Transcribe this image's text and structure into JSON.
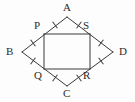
{
  "figure": {
    "background_color": "#fdfdfd",
    "stroke_color": "#3a3a3a",
    "label_color": "#2b2b2b",
    "tick_color": "#3a3a3a"
  },
  "outer_quadrilateral": {
    "name": "rhombus-abcd",
    "vertices": [
      {
        "id": "A",
        "label": "A",
        "x": 67,
        "y": 17
      },
      {
        "id": "B",
        "label": "B",
        "x": 22,
        "y": 52
      },
      {
        "id": "C",
        "label": "C",
        "x": 67,
        "y": 86
      },
      {
        "id": "D",
        "label": "D",
        "x": 113,
        "y": 52
      }
    ],
    "edges": [
      {
        "from": "A",
        "to": "B"
      },
      {
        "from": "B",
        "to": "C"
      },
      {
        "from": "C",
        "to": "D"
      },
      {
        "from": "D",
        "to": "A"
      }
    ]
  },
  "inner_quadrilateral": {
    "name": "rectangle-pqrs",
    "vertices": [
      {
        "id": "P",
        "label": "P",
        "x": 44,
        "y": 34
      },
      {
        "id": "S",
        "label": "S",
        "x": 90,
        "y": 34
      },
      {
        "id": "R",
        "label": "R",
        "x": 90,
        "y": 69
      },
      {
        "id": "Q",
        "label": "Q",
        "x": 44,
        "y": 69
      }
    ],
    "edges": [
      {
        "from": "P",
        "to": "S"
      },
      {
        "from": "S",
        "to": "R"
      },
      {
        "from": "R",
        "to": "Q"
      },
      {
        "from": "Q",
        "to": "P"
      }
    ]
  },
  "labels": [
    {
      "id": "label-A",
      "text": "A",
      "x": 63,
      "y": 2
    },
    {
      "id": "label-B",
      "text": "B",
      "x": 6,
      "y": 46
    },
    {
      "id": "label-C",
      "text": "C",
      "x": 63,
      "y": 88
    },
    {
      "id": "label-D",
      "text": "D",
      "x": 119,
      "y": 46
    },
    {
      "id": "label-P",
      "text": "P",
      "x": 34,
      "y": 20
    },
    {
      "id": "label-S",
      "text": "S",
      "x": 83,
      "y": 20
    },
    {
      "id": "label-Q",
      "text": "Q",
      "x": 34,
      "y": 70
    },
    {
      "id": "label-R",
      "text": "R",
      "x": 83,
      "y": 70
    }
  ],
  "tick_marks": [
    {
      "id": "tick-AP",
      "on_segment": "A-P",
      "x": 55,
      "y": 25,
      "angle": -37
    },
    {
      "id": "tick-AS",
      "on_segment": "A-S",
      "x": 79,
      "y": 25,
      "angle": 37
    },
    {
      "id": "tick-BP",
      "on_segment": "B-P",
      "x": 33,
      "y": 43,
      "angle": -37
    },
    {
      "id": "tick-BQ",
      "on_segment": "B-Q",
      "x": 33,
      "y": 61,
      "angle": 37
    },
    {
      "id": "tick-SD",
      "on_segment": "S-D",
      "x": 101,
      "y": 43,
      "angle": 37
    },
    {
      "id": "tick-RD",
      "on_segment": "R-D",
      "x": 101,
      "y": 61,
      "angle": -37
    },
    {
      "id": "tick-QC",
      "on_segment": "Q-C",
      "x": 55,
      "y": 78,
      "angle": 37
    },
    {
      "id": "tick-RC",
      "on_segment": "R-C",
      "x": 79,
      "y": 78,
      "angle": -37
    }
  ]
}
